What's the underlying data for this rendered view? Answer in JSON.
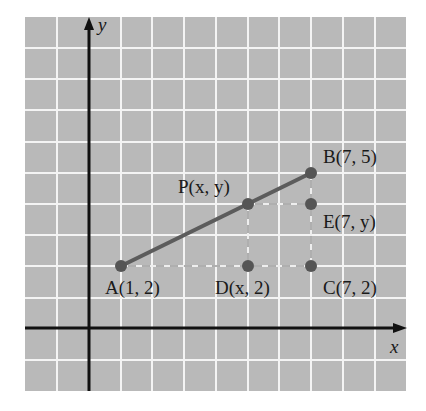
{
  "diagram": {
    "type": "coordinate-plane",
    "axes": {
      "x_label": "x",
      "y_label": "y"
    },
    "colors": {
      "background": "#b9b9b9",
      "grid": "#f4f4f4",
      "segment": "#5c5c5c",
      "point": "#555555",
      "axis": "#111111",
      "dashed": "#eeeeee"
    },
    "points": [
      {
        "id": "A",
        "name": "A",
        "coords": "(1, 2)",
        "x": 1,
        "y": 2
      },
      {
        "id": "B",
        "name": "B",
        "coords": "(7, 5)",
        "x": 7,
        "y": 5
      },
      {
        "id": "P",
        "name": "P",
        "coords": "(x, y)",
        "x": 5,
        "y": 4
      },
      {
        "id": "E",
        "name": "E",
        "coords": "(7, y)",
        "x": 7,
        "y": 4
      },
      {
        "id": "D",
        "name": "D",
        "coords": "(x, 2)",
        "x": 5,
        "y": 2
      },
      {
        "id": "C",
        "name": "C",
        "coords": "(7, 2)",
        "x": 7,
        "y": 2
      }
    ],
    "labels": {
      "A": "A(1, 2)",
      "B": "B(7, 5)",
      "P": "P(x, y)",
      "E": "E(7, y)",
      "D": "D(x, 2)",
      "C": "C(7, 2)"
    },
    "segments": [
      {
        "from": "A",
        "to": "B",
        "style": "solid"
      },
      {
        "from": "A",
        "to": "C",
        "style": "dashed"
      },
      {
        "from": "P",
        "to": "E",
        "style": "dashed"
      },
      {
        "from": "P",
        "to": "D",
        "style": "dashed"
      },
      {
        "from": "B",
        "to": "C",
        "style": "dashed"
      }
    ]
  }
}
